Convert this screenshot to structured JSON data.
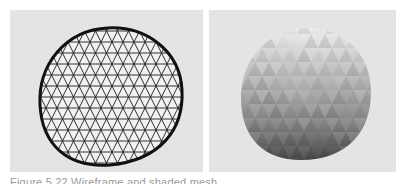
{
  "figure": {
    "panels": [
      {
        "id": "wireframe",
        "label": "wireframe-sphere-mesh",
        "background": "#e4e4e4",
        "stroke": "#1a1a1a"
      },
      {
        "id": "shaded",
        "label": "shaded-sphere-mesh",
        "background": "#e4e4e4",
        "top_color": "#e8e8e8",
        "bottom_color": "#555555"
      }
    ],
    "caption": "Figure 5.22  Wireframe and shaded mesh"
  }
}
